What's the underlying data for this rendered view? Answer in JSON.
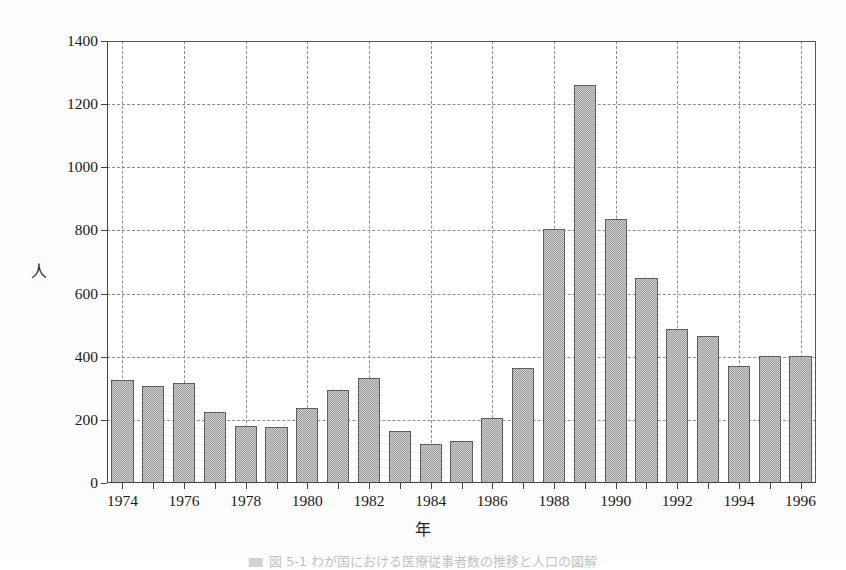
{
  "chart_data": {
    "type": "bar",
    "title": "",
    "xlabel": "年",
    "ylabel": "人",
    "ylim": [
      0,
      1400
    ],
    "ytick_step": 200,
    "grid": true,
    "legend": "none",
    "xlim": [
      1973.5,
      1996.5
    ],
    "xtick_labels": [
      "1974",
      "1976",
      "1978",
      "1980",
      "1982",
      "1984",
      "1986",
      "1988",
      "1990",
      "1992",
      "1994",
      "1996"
    ],
    "ytick_labels": [
      "0",
      "200",
      "400",
      "600",
      "800",
      "1000",
      "1200",
      "1400"
    ],
    "categories": [
      "1974",
      "1975",
      "1976",
      "1977",
      "1978",
      "1979",
      "1980",
      "1981",
      "1982",
      "1983",
      "1984",
      "1985",
      "1986",
      "1987",
      "1988",
      "1989",
      "1990",
      "1991",
      "1992",
      "1993",
      "1994",
      "1995",
      "1996"
    ],
    "values": [
      326,
      306,
      318,
      224,
      180,
      178,
      238,
      296,
      334,
      165,
      122,
      133,
      205,
      365,
      803,
      1262,
      835,
      650,
      488,
      467,
      370,
      403,
      403
    ],
    "bar_color": "#9a9a9a",
    "bar_edge_color": "#5e5e5e",
    "grid_color": "#8d8d8d",
    "axis_color": "#444444",
    "background": "#ffffff"
  },
  "caption": {
    "text": "図 5-1  わが国における医療従事者数の推移と人口の図解"
  }
}
